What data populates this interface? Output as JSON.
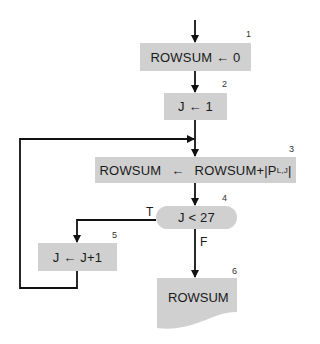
{
  "diagram": {
    "type": "flowchart",
    "nodes": [
      {
        "id": 1,
        "shape": "process",
        "text": "ROWSUM ← 0",
        "number": "1"
      },
      {
        "id": 2,
        "shape": "process",
        "text": "J ← 1",
        "number": "2"
      },
      {
        "id": 3,
        "shape": "process",
        "text_left": "ROWSUM",
        "arrow": "←",
        "text_right": "ROWSUM+|P",
        "subscript": "L,J",
        "text_end": "|",
        "number": "3"
      },
      {
        "id": 4,
        "shape": "decision",
        "text": "J < 27",
        "number": "4"
      },
      {
        "id": 5,
        "shape": "process",
        "text": "J ← J+1",
        "number": "5"
      },
      {
        "id": 6,
        "shape": "document",
        "text": "ROWSUM",
        "number": "6"
      }
    ],
    "edges": [
      {
        "from": "start",
        "to": 1
      },
      {
        "from": 1,
        "to": 2
      },
      {
        "from": 2,
        "to": 3
      },
      {
        "from": 3,
        "to": 4
      },
      {
        "from": 4,
        "to": 5,
        "label": "T"
      },
      {
        "from": 4,
        "to": 6,
        "label": "F"
      },
      {
        "from": 5,
        "to": 3,
        "label": "loop"
      }
    ],
    "labels": {
      "true": "T",
      "false": "F"
    },
    "colors": {
      "box_fill": "#d0d0d0",
      "line": "#111111"
    }
  }
}
